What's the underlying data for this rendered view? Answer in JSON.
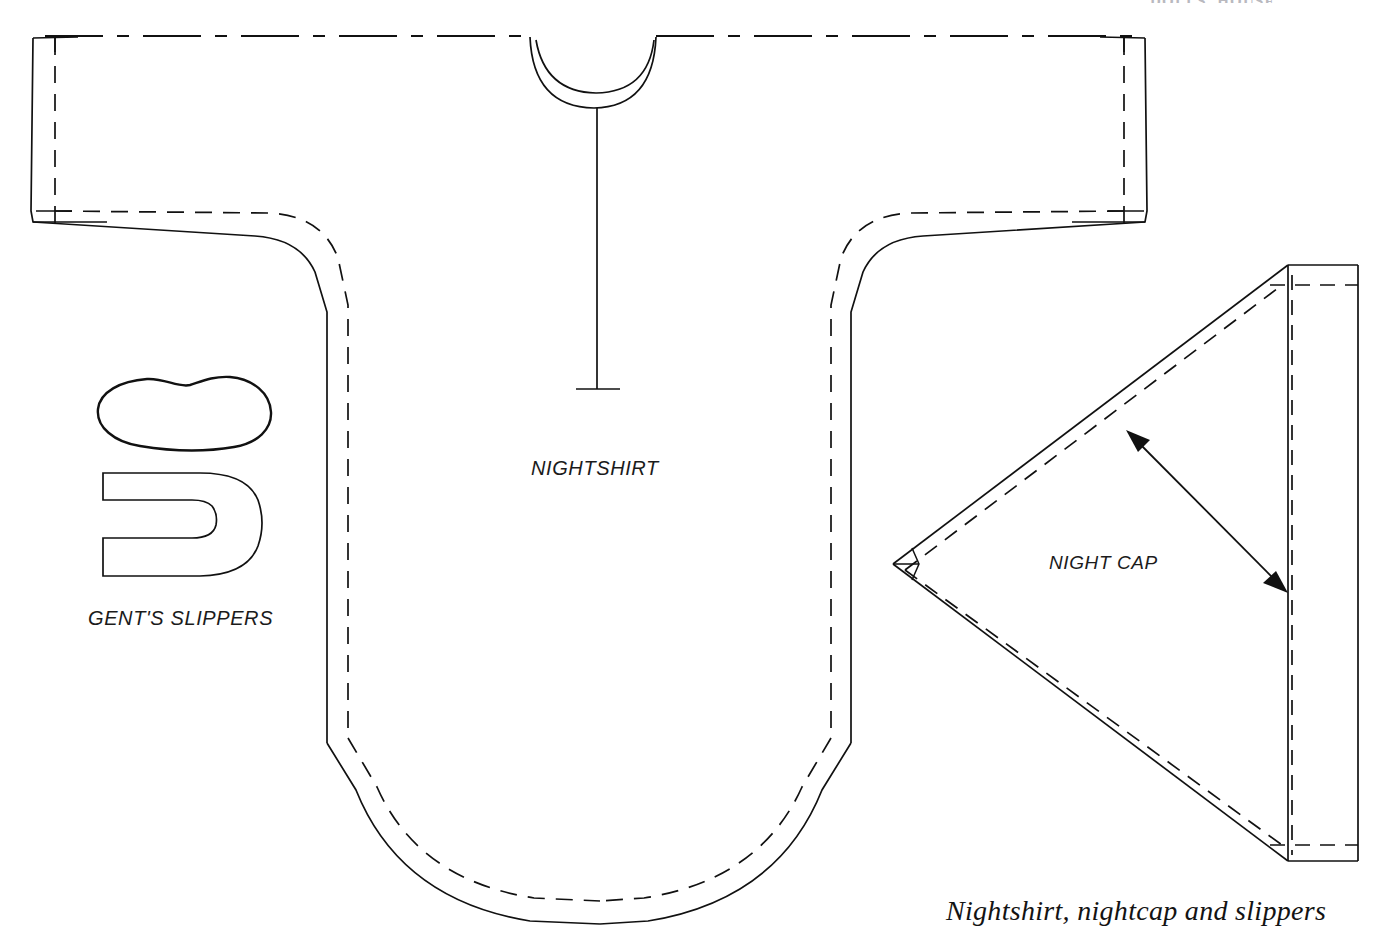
{
  "document": {
    "type": "sewing-pattern-diagram",
    "page_header": "DOLLS' HOUSE",
    "caption": "Nightshirt, nightcap and slippers",
    "background_color": "#ffffff",
    "ink_color": "#111111"
  },
  "labels": {
    "nightshirt": "NIGHTSHIRT",
    "nightcap": "NIGHT CAP",
    "slippers": "GENT'S SLIPPERS"
  },
  "legend": {
    "solid_line": "cutting line",
    "dashed_line": "stitching / seam line",
    "dash_dot_line": "fold line",
    "double_arrow": "grainline"
  },
  "pieces": [
    {
      "name": "nightshirt",
      "label": "NIGHTSHIRT",
      "description": "T-shaped one-piece nightshirt cut on the fold at the shoulder line, with rounded neckline, front placket and deep curved hem",
      "features": [
        "fold-line-top",
        "neckline-arc",
        "neckband-arc",
        "front-placket",
        "cuffs",
        "underarm-curve",
        "side-seams",
        "curved-hem",
        "seam-allowance-dashes"
      ]
    },
    {
      "name": "nightcap",
      "label": "NIGHT CAP",
      "description": "Right-pointing triangular cap piece with straight back edge band and grainline arrow",
      "features": [
        "triangle-outline",
        "seam-allowance-dashes",
        "back-band",
        "grainline-arrow"
      ]
    },
    {
      "name": "slipper-sole",
      "label": "GENT'S SLIPPERS",
      "description": "Foot-shaped sole outline",
      "features": [
        "sole-outline"
      ]
    },
    {
      "name": "slipper-upper",
      "label": "GENT'S SLIPPERS",
      "description": "U-shaped slipper upper / vamp piece",
      "features": [
        "horseshoe-outline"
      ]
    }
  ]
}
